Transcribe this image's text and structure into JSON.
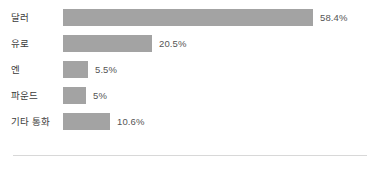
{
  "chart_data": {
    "type": "bar",
    "orientation": "horizontal",
    "title": "",
    "subtitle": "",
    "xlabel": "",
    "ylabel": "",
    "grid": false,
    "legend": false,
    "xlim": [
      0,
      58.4
    ],
    "categories": [
      "달러",
      "유로",
      "엔",
      "파운드",
      "기타 통화"
    ],
    "values": [
      58.4,
      20.5,
      5.5,
      5,
      10.6
    ],
    "value_labels": [
      "58.4%",
      "20.5%",
      "5.5%",
      "5%",
      "10.6%"
    ],
    "bar_color": "#a3a3a3",
    "label_color": "#3c3c3c",
    "value_label_color": "#555555",
    "divider_color": "#d8d8d8",
    "background": "#ffffff",
    "bar_pixel_widths": [
      250,
      89,
      25,
      23,
      47
    ],
    "rows": [
      {
        "category": "달러",
        "value": 58.4,
        "value_label": "58.4%",
        "bar_width": 250
      },
      {
        "category": "유로",
        "value": 20.5,
        "value_label": "20.5%",
        "bar_width": 89
      },
      {
        "category": "엔",
        "value": 5.5,
        "value_label": "5.5%",
        "bar_width": 25
      },
      {
        "category": "파운드",
        "value": 5,
        "value_label": "5%",
        "bar_width": 23
      },
      {
        "category": "기타 통화",
        "value": 10.6,
        "value_label": "10.6%",
        "bar_width": 47
      }
    ]
  }
}
